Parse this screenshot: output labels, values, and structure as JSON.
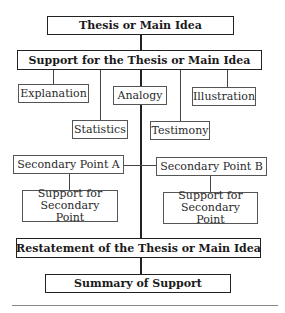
{
  "diagram": {
    "thesis": "Thesis or Main Idea",
    "support": "Support for the Thesis or Main Idea",
    "support_types": {
      "explanation": "Explanation",
      "analogy": "Analogy",
      "illustration": "Illustration",
      "statistics": "Statistics",
      "testimony": "Testimony"
    },
    "secondary_a": "Secondary Point A",
    "secondary_b": "Secondary Point B",
    "support_a": "Support for Secondary Point",
    "support_b": "Support for Secondary Point",
    "restatement": "Restatement of the Thesis or Main Idea",
    "summary": "Summary of Support"
  }
}
